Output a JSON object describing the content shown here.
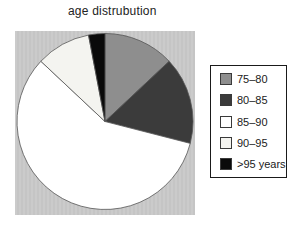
{
  "chart_data": {
    "type": "pie",
    "title": "age distrubution",
    "categories": [
      "75–80",
      "80–85",
      "85–90",
      "90–95",
      ">95 years"
    ],
    "values": [
      13,
      16,
      58,
      10,
      3
    ],
    "unit": "percent_estimated_from_slice_angles",
    "colors": [
      "#8e8e8e",
      "#3b3b3b",
      "#ffffff",
      "#f4f4f0",
      "#0a0a0a"
    ],
    "start_angle_deg": 0,
    "direction": "clockwise",
    "legend_position": "right",
    "plot_background": "#c8c8c8",
    "slice_outline_color": "#555555"
  }
}
